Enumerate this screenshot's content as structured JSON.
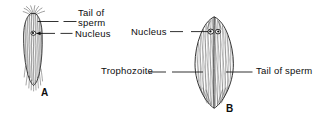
{
  "figure": {
    "kind": "scientific-line-drawing",
    "background_color": "#ffffff",
    "ink_color": "#0d0d0d",
    "panels": [
      {
        "letter": "A",
        "subject": "trophozoite-with-ingested-sperm-elongated",
        "callouts": [
          {
            "name": "tail-of-sperm",
            "line1": "Tail of",
            "line2": "sperm",
            "leader": "dashed-double-segment"
          },
          {
            "name": "nucleus",
            "line1": "Nucleus",
            "leader": "arrow-pointing-left"
          }
        ]
      },
      {
        "letter": "B",
        "subject": "trophozoite-with-ingested-sperm-broad",
        "callouts": [
          {
            "name": "nucleus",
            "line1": "Nucleus",
            "leader": "line-pointing-right"
          },
          {
            "name": "trophozoite",
            "line1": "Trophozoite",
            "leader": "line-pointing-right"
          },
          {
            "name": "tail-of-sperm",
            "line1": "Tail of sperm",
            "leader": "line-pointing-left"
          }
        ]
      }
    ]
  },
  "labels": {
    "a_tail_line1": "Tail of",
    "a_tail_line2": "sperm",
    "a_nucleus": "Nucleus",
    "a_letter": "A",
    "b_nucleus": "Nucleus",
    "b_trophozoite": "Trophozoite",
    "b_tail": "Tail of sperm",
    "b_letter": "B"
  }
}
